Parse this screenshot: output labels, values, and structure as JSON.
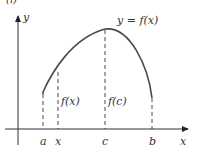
{
  "figure": {
    "corner_label": "(i)",
    "curve_label": "y = f(x)",
    "axes": {
      "x_label": "x",
      "y_label": "y"
    },
    "ticks": [
      {
        "label": "a",
        "x": 43
      },
      {
        "label": "x",
        "x": 58
      },
      {
        "label": "c",
        "x": 105
      },
      {
        "label": "b",
        "x": 152
      }
    ],
    "heights": [
      {
        "label": "f(x)",
        "at": "x"
      },
      {
        "label": "f(c)",
        "at": "c"
      }
    ],
    "colors": {
      "curve": "#4a4a4a",
      "axes": "#333333",
      "dashed": "#333333",
      "text": "#333333"
    }
  }
}
